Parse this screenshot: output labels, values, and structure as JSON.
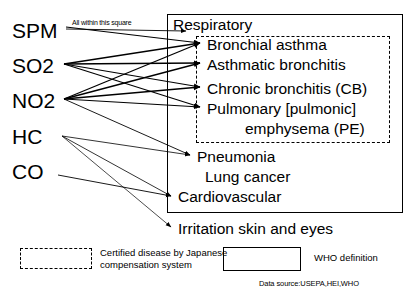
{
  "diagram": {
    "title_note": "All within this square",
    "pollutants": [
      {
        "id": "spm",
        "label": "SPM",
        "x": 12,
        "y": 20
      },
      {
        "id": "so2",
        "label": "SO2",
        "x": 12,
        "y": 55
      },
      {
        "id": "no2",
        "label": "NO2",
        "x": 12,
        "y": 90
      },
      {
        "id": "hc",
        "label": "HC",
        "x": 12,
        "y": 126
      },
      {
        "id": "co",
        "label": "CO",
        "x": 12,
        "y": 161
      }
    ],
    "who_box": {
      "label": "WHO definition"
    },
    "certified_box": {
      "label": "Certified disease by Japanese compensation system"
    },
    "diseases": [
      {
        "id": "respiratory",
        "label": "Respiratory",
        "x": 173,
        "y": 17,
        "certified": false,
        "arrow": true
      },
      {
        "id": "bronchial-asthma",
        "label": "Bronchial asthma",
        "x": 207,
        "y": 37,
        "certified": true,
        "arrow": true
      },
      {
        "id": "asthmatic-bronchitis",
        "label": "Asthmatic bronchitis",
        "x": 207,
        "y": 57,
        "certified": true,
        "arrow": true
      },
      {
        "id": "chronic-bronchitis",
        "label": "Chronic bronchitis (CB)",
        "x": 207,
        "y": 81,
        "certified": true,
        "arrow": true
      },
      {
        "id": "pulmonary-emphysema",
        "label": "Pulmonary [pulmonic]",
        "x": 207,
        "y": 101,
        "certified": true,
        "arrow": true
      },
      {
        "id": "pulmonary-emphysema-2",
        "label": "emphysema (PE)",
        "x": 245,
        "y": 121,
        "certified": true,
        "arrow": false
      },
      {
        "id": "pneumonia",
        "label": "Pneumonia",
        "x": 197,
        "y": 149,
        "certified": false,
        "arrow": true
      },
      {
        "id": "lung-cancer",
        "label": "Lung cancer",
        "x": 205,
        "y": 169,
        "certified": false,
        "arrow": false
      },
      {
        "id": "cardiovascular",
        "label": "Cardiovascular",
        "x": 178,
        "y": 189,
        "certified": false,
        "arrow": true
      },
      {
        "id": "irritation-skin-eyes",
        "label": "Irritation skin and eyes",
        "x": 178,
        "y": 221,
        "certified": false,
        "arrow": true
      }
    ],
    "legend": {
      "certified_label": "Certified disease by Japanese\ncompensation system",
      "who_label": "WHO definition",
      "data_source": "Data source:USEPA,HEI,WHO"
    },
    "colors": {
      "line": "#000000",
      "text": "#000000",
      "background": "#ffffff"
    }
  }
}
